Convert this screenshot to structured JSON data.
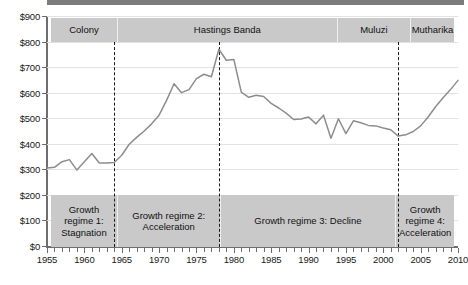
{
  "chart_data": {
    "type": "line",
    "title": "",
    "xlabel": "",
    "ylabel": "",
    "xlim": [
      1955,
      2010
    ],
    "ylim": [
      0,
      900
    ],
    "grid": true,
    "legend": "none",
    "currency_prefix": "$",
    "y_ticks": [
      0,
      100,
      200,
      300,
      400,
      500,
      600,
      700,
      800,
      900
    ],
    "y_tick_labels": [
      "$0",
      "$100",
      "$200",
      "$300",
      "$400",
      "$500",
      "$600",
      "$700",
      "$800",
      "$900"
    ],
    "x_ticks": [
      1955,
      1960,
      1965,
      1970,
      1975,
      1980,
      1985,
      1990,
      1995,
      2000,
      2005,
      2010
    ],
    "x_tick_labels": [
      "1955",
      "1960",
      "1965",
      "1970",
      "1975",
      "1980",
      "1985",
      "1990",
      "1995",
      "2000",
      "2005",
      "2010"
    ],
    "x_minor_tick_interval": 1,
    "series": [
      {
        "name": "GDP per capita",
        "color": "#8d8d8d",
        "x": [
          1955,
          1956,
          1957,
          1958,
          1959,
          1960,
          1961,
          1962,
          1963,
          1964,
          1965,
          1966,
          1967,
          1968,
          1969,
          1970,
          1971,
          1972,
          1973,
          1974,
          1975,
          1976,
          1977,
          1978,
          1979,
          1980,
          1981,
          1982,
          1983,
          1984,
          1985,
          1986,
          1987,
          1988,
          1989,
          1990,
          1991,
          1992,
          1993,
          1994,
          1995,
          1996,
          1997,
          1998,
          1999,
          2000,
          2001,
          2002,
          2003,
          2004,
          2005,
          2006,
          2007,
          2008,
          2009,
          2010
        ],
        "values": [
          305,
          308,
          330,
          338,
          297,
          330,
          362,
          325,
          325,
          327,
          355,
          398,
          425,
          450,
          478,
          512,
          570,
          635,
          600,
          612,
          655,
          672,
          662,
          770,
          727,
          730,
          602,
          582,
          590,
          585,
          558,
          540,
          520,
          495,
          497,
          505,
          478,
          512,
          422,
          498,
          440,
          490,
          482,
          472,
          470,
          462,
          455,
          430,
          435,
          448,
          470,
          505,
          545,
          580,
          612,
          648
        ]
      }
    ],
    "vertical_markers": [
      {
        "x": 1964,
        "style": "dashed",
        "color": "#1a1a1a"
      },
      {
        "x": 1978,
        "style": "dashed",
        "color": "#1a1a1a"
      },
      {
        "x": 2002,
        "style": "dashed",
        "color": "#1a1a1a"
      }
    ],
    "top_bands": [
      {
        "label": "Colony",
        "start": 1955,
        "end": 1964
      },
      {
        "label": "Hastings Banda",
        "start": 1964,
        "end": 1994
      },
      {
        "label": "Muluzi",
        "start": 1994,
        "end": 2004
      },
      {
        "label": "Mutharika",
        "start": 2004,
        "end": 2010
      }
    ],
    "bottom_bands": [
      {
        "label": "Growth regime 1: Stagnation",
        "start": 1955,
        "end": 1964
      },
      {
        "label": "Growth regime 2: Acceleration",
        "start": 1964,
        "end": 1978
      },
      {
        "label": "Growth regime 3: Decline",
        "start": 1978,
        "end": 2002
      },
      {
        "label": "Growth regime 4: Acceleration",
        "start": 2002,
        "end": 2010
      }
    ],
    "colors": {
      "band_fill": "#c9c9c9",
      "line": "#8d8d8d",
      "gridline": "#e2e2e2",
      "axis": "#6e6e6e",
      "text": "#1a1a1a"
    }
  }
}
